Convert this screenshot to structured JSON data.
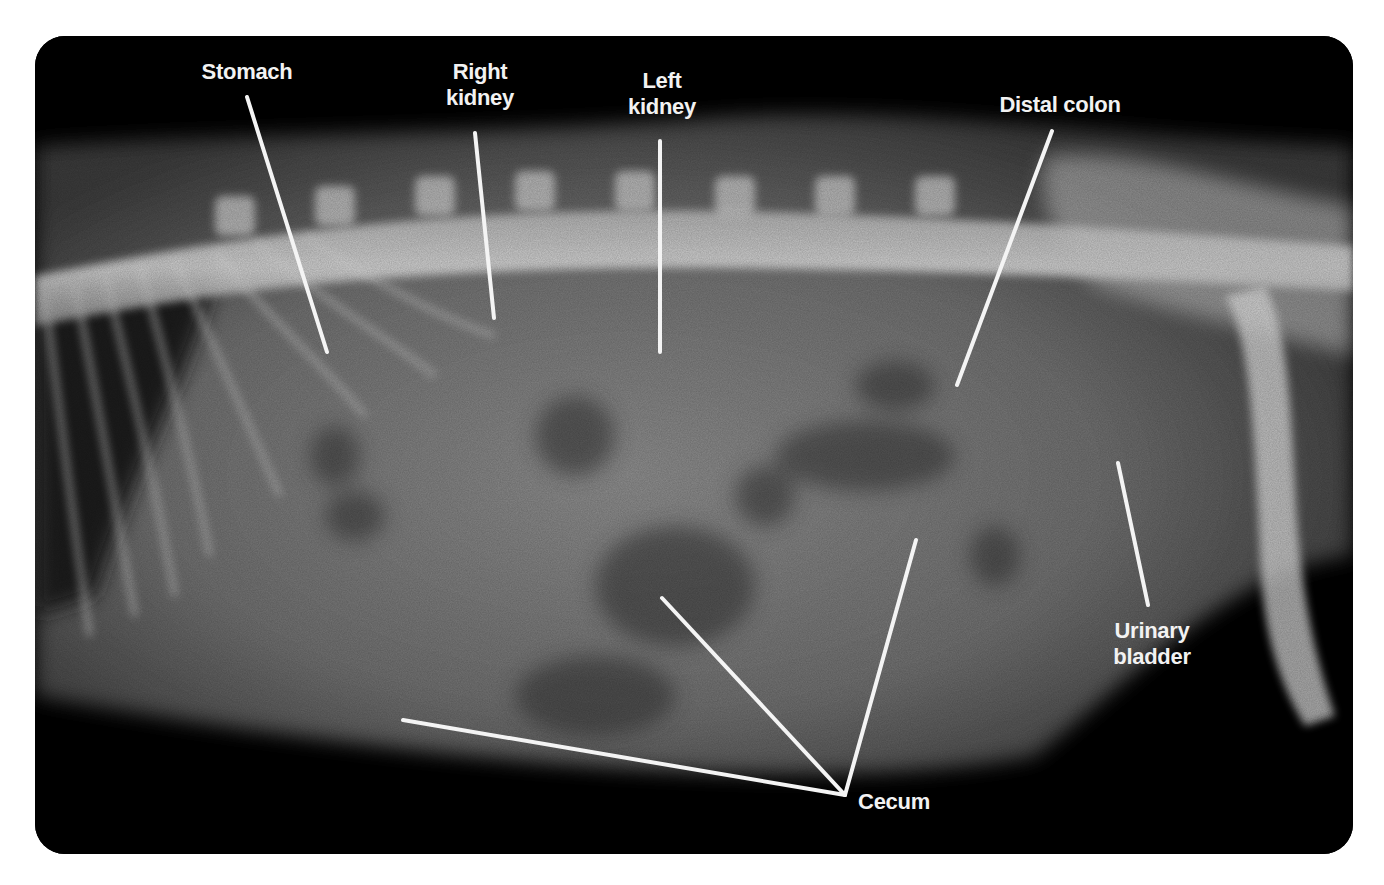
{
  "figure": {
    "background": "#ffffff",
    "frame_color": "#000000",
    "line_color": "#f4f4f4",
    "text_color": "#f2f2f2"
  },
  "labels": {
    "stomach": "Stomach",
    "right_kidney": "Right\nkidney",
    "left_kidney": "Left\nkidney",
    "distal_colon": "Distal colon",
    "urinary_bladder": "Urinary\nbladder",
    "cecum": "Cecum"
  }
}
